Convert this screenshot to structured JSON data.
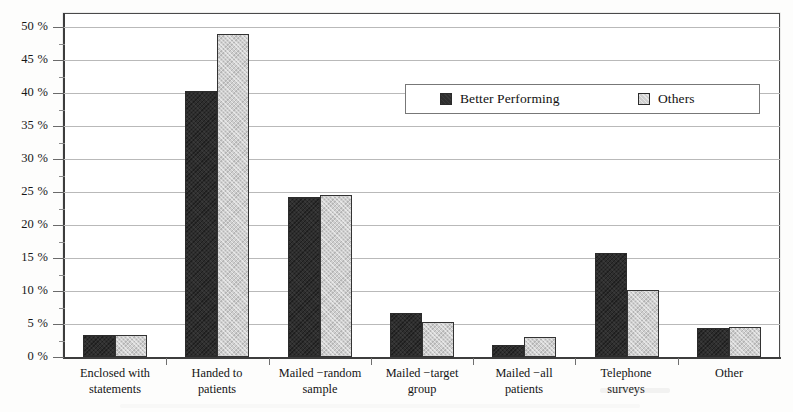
{
  "chart_data": {
    "type": "bar",
    "title": "",
    "subtitle": "",
    "xlabel": "",
    "ylabel": "",
    "grid": true,
    "legend_position": "inside-upper-right",
    "ylim": [
      0,
      52
    ],
    "ytick_values": [
      0,
      5,
      10,
      15,
      20,
      25,
      30,
      35,
      40,
      45,
      50
    ],
    "ytick_labels": [
      "0 %",
      "5 %",
      "10 %",
      "15 %",
      "20 %",
      "25 %",
      "30 %",
      "35 %",
      "40 %",
      "45 %",
      "50 %"
    ],
    "categories": [
      "Enclosed with statements",
      "Handed to patients",
      "Mailed −random sample",
      "Mailed −target group",
      "Mailed −all patients",
      "Telephone surveys",
      "Other"
    ],
    "category_lines": [
      [
        "Enclosed with",
        "statements"
      ],
      [
        "Handed to",
        "patients"
      ],
      [
        "Mailed −random",
        "sample"
      ],
      [
        "Mailed −target",
        "group"
      ],
      [
        "Mailed −all",
        "patients"
      ],
      [
        "Telephone",
        "surveys"
      ],
      [
        "Other",
        ""
      ]
    ],
    "series": [
      {
        "name": "Better Performing",
        "color": "#2e2e2e",
        "values": [
          3.4,
          40.4,
          24.3,
          6.6,
          1.8,
          15.8,
          4.4
        ]
      },
      {
        "name": "Others",
        "color": "#cfcfcf",
        "values": [
          3.4,
          49.0,
          24.6,
          5.3,
          3.0,
          10.2,
          4.6
        ]
      }
    ]
  },
  "legend": {
    "entries": [
      {
        "label": "Better Performing",
        "swatch": "dark-filled-square"
      },
      {
        "label": "Others",
        "swatch": "light-filled-square"
      }
    ]
  },
  "colors": {
    "series_better_performing": "#2e2e2e",
    "series_others": "#cfcfcf",
    "gridline": "#b9b9b9",
    "axis": "#3d3d3d",
    "background": "#ffffff"
  }
}
